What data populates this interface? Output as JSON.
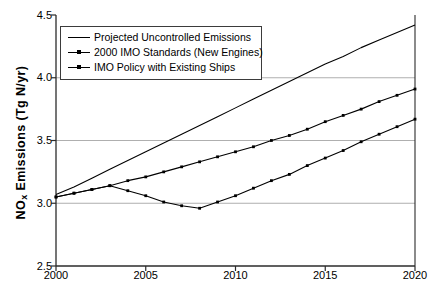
{
  "chart_data": {
    "type": "line",
    "title": "",
    "xlabel": "",
    "ylabel": "NOx Emissions (Tg N/yr)",
    "ylabel_main": "NO",
    "ylabel_sub": "x",
    "ylabel_rest": " Emissions (Tg N/yr)",
    "xlim": [
      2000,
      2020
    ],
    "ylim": [
      2.5,
      4.5
    ],
    "xticks": [
      2000,
      2005,
      2010,
      2015,
      2020
    ],
    "xtick_labels": [
      "2000",
      "2005",
      "2010",
      "2015",
      "2020"
    ],
    "yticks": [
      2.5,
      3.0,
      3.5,
      4.0,
      4.5
    ],
    "ytick_labels": [
      "2.5",
      "3.0",
      "3.5",
      "4.0",
      "4.5"
    ],
    "gridlines_y": [
      3.0,
      3.5,
      4.0
    ],
    "grid": true,
    "grid_color": "#9a9a9a",
    "legend_position": "upper-left",
    "line_color": "#000000",
    "x": [
      2000,
      2001,
      2002,
      2003,
      2004,
      2005,
      2006,
      2007,
      2008,
      2009,
      2010,
      2011,
      2012,
      2013,
      2014,
      2015,
      2016,
      2017,
      2018,
      2019,
      2020
    ],
    "series": [
      {
        "name": "Projected Uncontrolled Emissions",
        "marker": "none",
        "values": [
          3.07,
          3.13,
          3.2,
          3.27,
          3.34,
          3.41,
          3.48,
          3.55,
          3.62,
          3.69,
          3.76,
          3.83,
          3.9,
          3.97,
          4.04,
          4.11,
          4.17,
          4.24,
          4.3,
          4.36,
          4.42
        ]
      },
      {
        "name": "2000 IMO Standards (New Engines)",
        "marker": "point",
        "values": [
          3.05,
          3.08,
          3.11,
          3.14,
          3.18,
          3.21,
          3.25,
          3.29,
          3.33,
          3.37,
          3.41,
          3.45,
          3.5,
          3.54,
          3.59,
          3.65,
          3.7,
          3.75,
          3.81,
          3.86,
          3.91
        ]
      },
      {
        "name": "IMO Policy with Existing Ships",
        "marker": "point",
        "values": [
          3.05,
          3.08,
          3.11,
          3.14,
          3.1,
          3.06,
          3.01,
          2.98,
          2.96,
          3.01,
          3.06,
          3.12,
          3.18,
          3.23,
          3.3,
          3.36,
          3.42,
          3.49,
          3.55,
          3.61,
          3.67
        ]
      }
    ]
  },
  "legend": {
    "items": [
      {
        "label": "Projected Uncontrolled Emissions"
      },
      {
        "label": "2000 IMO Standards (New Engines)"
      },
      {
        "label": "IMO Policy with Existing Ships"
      }
    ]
  }
}
